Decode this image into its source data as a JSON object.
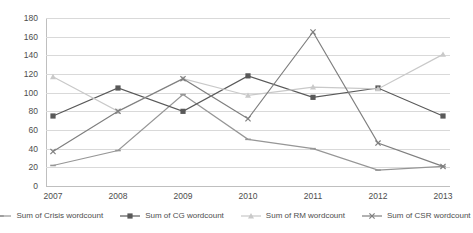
{
  "chart_data": {
    "type": "line",
    "title": "",
    "xlabel": "",
    "ylabel": "",
    "categories": [
      "2007",
      "2008",
      "2009",
      "2010",
      "2011",
      "2012",
      "2013"
    ],
    "ylim": [
      0,
      180
    ],
    "ytick_step": 20,
    "yticks": [
      "180",
      "160",
      "140",
      "120",
      "100",
      "80",
      "60",
      "40",
      "20",
      "0"
    ],
    "grid": true,
    "legend_position": "bottom",
    "series": [
      {
        "name": "Sum of Crisis wordcount",
        "color": "#969696",
        "marker": "dash",
        "values": [
          22,
          38,
          98,
          50,
          40,
          17,
          21
        ]
      },
      {
        "name": "Sum of CG wordcount",
        "color": "#595959",
        "marker": "square",
        "values": [
          75,
          105,
          80,
          118,
          95,
          105,
          75
        ]
      },
      {
        "name": "Sum of RM wordcount",
        "color": "#c9c9c9",
        "marker": "triangle",
        "values": [
          117,
          80,
          115,
          97,
          106,
          104,
          141
        ]
      },
      {
        "name": "Sum of CSR wordcount",
        "color": "#7f7f7f",
        "marker": "x",
        "values": [
          37,
          80,
          115,
          72,
          165,
          46,
          21
        ]
      }
    ]
  }
}
